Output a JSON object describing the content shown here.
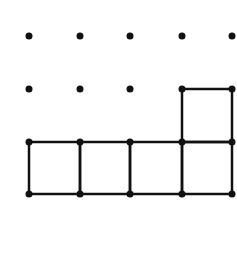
{
  "diagram": {
    "type": "dot-grid-polyomino",
    "colors": {
      "background": "#ffffff",
      "ink": "#111111"
    },
    "grid": {
      "columns_x": [
        29,
        80,
        130,
        182,
        232
      ],
      "rows_y": [
        36,
        89,
        142,
        194
      ],
      "dot_radius": 3.5,
      "line_width": 2.5
    },
    "dots": [
      [
        0,
        0
      ],
      [
        1,
        0
      ],
      [
        2,
        0
      ],
      [
        3,
        0
      ],
      [
        4,
        0
      ],
      [
        0,
        1
      ],
      [
        1,
        1
      ],
      [
        2,
        1
      ],
      [
        3,
        1
      ],
      [
        4,
        1
      ],
      [
        0,
        2
      ],
      [
        1,
        2
      ],
      [
        2,
        2
      ],
      [
        3,
        2
      ],
      [
        4,
        2
      ],
      [
        0,
        3
      ],
      [
        1,
        3
      ],
      [
        2,
        3
      ],
      [
        3,
        3
      ],
      [
        4,
        3
      ]
    ],
    "squares": [
      {
        "col": 3,
        "row": 1
      },
      {
        "col": 0,
        "row": 2
      },
      {
        "col": 1,
        "row": 2
      },
      {
        "col": 2,
        "row": 2
      },
      {
        "col": 3,
        "row": 2
      }
    ],
    "square_count": 5
  }
}
